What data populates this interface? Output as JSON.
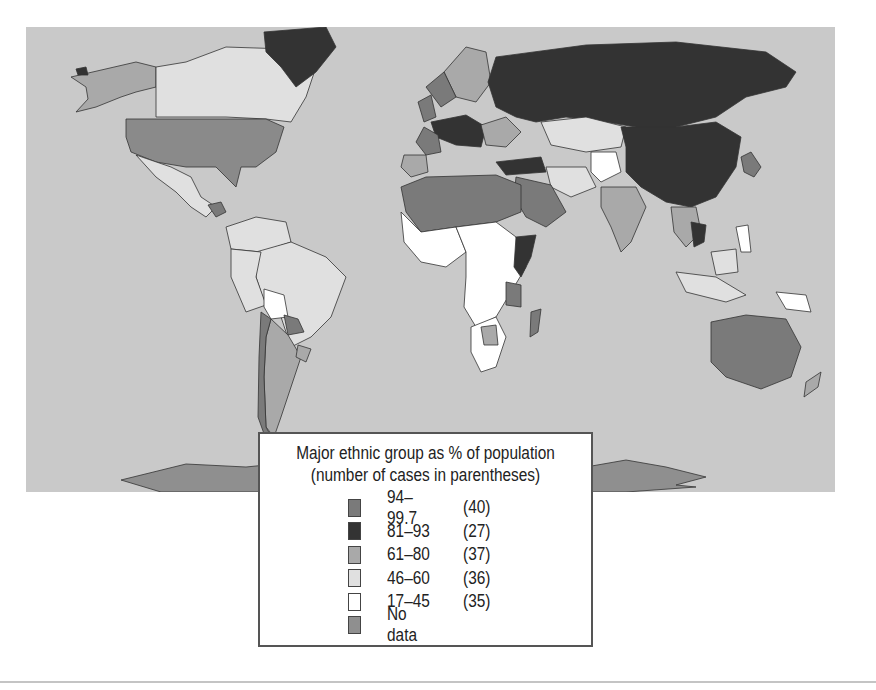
{
  "map": {
    "title": "Major ethnic group as % of population",
    "background_color": "#c9c9c9",
    "colors": {
      "c94_99": "#7a7a7a",
      "c81_93": "#333333",
      "c61_80": "#a9a9a9",
      "c46_60": "#e0e0e0",
      "c17_45": "#ffffff",
      "nodata": "#8f8f8f"
    }
  },
  "legend": {
    "title_line1": "Major ethnic group as % of population",
    "title_line2": "(number of cases in parentheses)",
    "items": [
      {
        "range": "94–99.7",
        "count": "(40)",
        "color": "#7a7a7a"
      },
      {
        "range": "81–93",
        "count": "(27)",
        "color": "#333333"
      },
      {
        "range": "61–80",
        "count": "(37)",
        "color": "#a9a9a9"
      },
      {
        "range": "46–60",
        "count": "(36)",
        "color": "#e0e0e0"
      },
      {
        "range": "17–45",
        "count": "(35)",
        "color": "#ffffff"
      },
      {
        "range": "No data",
        "count": "",
        "color": "#8f8f8f"
      }
    ]
  }
}
